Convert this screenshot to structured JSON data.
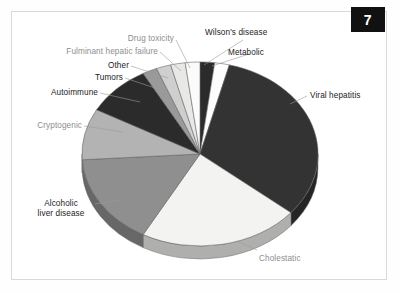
{
  "figure": {
    "badge_number": "7",
    "border_color": "#d9d9d9",
    "background": "#ffffff"
  },
  "chart_data": {
    "type": "pie",
    "title": "",
    "xlabel": "",
    "ylabel": "",
    "legend_position": "callout-labels",
    "grid": false,
    "start_angle_deg": 0,
    "direction": "clockwise",
    "categories": [
      "Metabolic",
      "Wilson's disease",
      "Viral hepatitis",
      "Cholestatic",
      "Alcoholic liver disease",
      "Cryptogenic",
      "Autoimmune",
      "Tumors",
      "Other",
      "Fulminant hepatic failure",
      "Drug toxicity"
    ],
    "values": [
      2,
      2,
      32,
      22,
      16,
      9,
      9,
      2,
      2,
      2,
      2
    ],
    "colors": [
      "#2b2b2b",
      "#fdfdfd",
      "#333333",
      "#f3f3f1",
      "#8f8f8f",
      "#b3b3b3",
      "#2b2b2b",
      "#9a9a9a",
      "#cfcfcf",
      "#e8e8e6",
      "#fbfbfb"
    ],
    "slices": [
      {
        "label": "Metabolic",
        "value": 2,
        "color": "#2b2b2b",
        "label_color": "#1b1b1b"
      },
      {
        "label": "Wilson's disease",
        "value": 2,
        "color": "#fdfdfd",
        "label_color": "#1b1b1b"
      },
      {
        "label": "Viral hepatitis",
        "value": 32,
        "color": "#333333",
        "label_color": "#1b1b1b"
      },
      {
        "label": "Cholestatic",
        "value": 22,
        "color": "#f3f3f1",
        "label_color": "#8e8e8e"
      },
      {
        "label": "Alcoholic liver disease",
        "value": 16,
        "color": "#8f8f8f",
        "label_color": "#1b1b1b"
      },
      {
        "label": "Cryptogenic",
        "value": 9,
        "color": "#b3b3b3",
        "label_color": "#8e8e8e"
      },
      {
        "label": "Autoimmune",
        "value": 9,
        "color": "#2b2b2b",
        "label_color": "#1b1b1b"
      },
      {
        "label": "Tumors",
        "value": 2,
        "color": "#9a9a9a",
        "label_color": "#1b1b1b"
      },
      {
        "label": "Other",
        "value": 2,
        "color": "#cfcfcf",
        "label_color": "#1b1b1b"
      },
      {
        "label": "Fulminant hepatic failure",
        "value": 2,
        "color": "#e8e8e6",
        "label_color": "#8e8e8e"
      },
      {
        "label": "Drug toxicity",
        "value": 2,
        "color": "#fbfbfb",
        "label_color": "#8e8e8e"
      }
    ]
  },
  "labels": {
    "viral_hepatitis": "Viral hepatitis",
    "cholestatic": "Cholestatic",
    "alcoholic_liver_disease_line1": "Alcoholic",
    "alcoholic_liver_disease_line2": "liver disease",
    "cryptogenic": "Cryptogenic",
    "autoimmune": "Autoimmune",
    "tumors": "Tumors",
    "other": "Other",
    "fulminant_hepatic_failure": "Fulminant hepatic failure",
    "drug_toxicity": "Drug toxicity",
    "wilsons_disease": "Wilson's disease",
    "metabolic": "Metabolic"
  }
}
